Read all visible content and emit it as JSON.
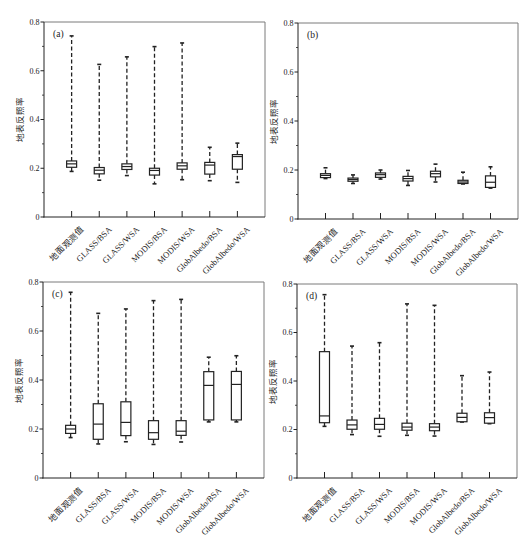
{
  "style": {
    "box_stroke": "#222222",
    "axis_color": "#222222",
    "frame_color": "#7a7a7a",
    "box_fill": "#ffffff",
    "background": "#ffffff"
  },
  "chart_data": [
    {
      "type": "box",
      "panel_label": "(a)",
      "title": "",
      "xlabel": "",
      "ylabel": "地表反照率",
      "ylim": [
        0,
        0.8
      ],
      "yticks": [
        0,
        0.2,
        0.4,
        0.6,
        0.8
      ],
      "ytick_labels": [
        "0",
        "0.2",
        "0.4",
        "0.6",
        "0.8"
      ],
      "minor_yticks": [
        0.1,
        0.3,
        0.5,
        0.7
      ],
      "grid": false,
      "legend": null,
      "categories": [
        "地面观测值",
        "GLASS/BSA",
        "GLASS/WSA",
        "MODIS/BSA",
        "MODIS/WSA",
        "GlobAlbedo/BSA",
        "GlobAlbedo/WSA"
      ],
      "boxes": [
        {
          "min": 0.187,
          "q1": 0.204,
          "median": 0.218,
          "q3": 0.23,
          "max": 0.743
        },
        {
          "min": 0.151,
          "q1": 0.177,
          "median": 0.192,
          "q3": 0.203,
          "max": 0.626
        },
        {
          "min": 0.17,
          "q1": 0.195,
          "median": 0.207,
          "q3": 0.218,
          "max": 0.657
        },
        {
          "min": 0.136,
          "q1": 0.172,
          "median": 0.191,
          "q3": 0.2,
          "max": 0.699
        },
        {
          "min": 0.153,
          "q1": 0.196,
          "median": 0.21,
          "q3": 0.222,
          "max": 0.714
        },
        {
          "min": 0.149,
          "q1": 0.176,
          "median": 0.213,
          "q3": 0.224,
          "max": 0.286
        },
        {
          "min": 0.142,
          "q1": 0.196,
          "median": 0.248,
          "q3": 0.256,
          "max": 0.303
        }
      ]
    },
    {
      "type": "box",
      "panel_label": "(b)",
      "title": "",
      "xlabel": "",
      "ylabel": "地表反照率",
      "ylim": [
        0,
        0.8
      ],
      "yticks": [
        0,
        0.2,
        0.4,
        0.6,
        0.8
      ],
      "ytick_labels": [
        "0",
        "0.2",
        "0.4",
        "0.6",
        "0.8"
      ],
      "minor_yticks": [
        0.1,
        0.3,
        0.5,
        0.7
      ],
      "grid": false,
      "legend": null,
      "categories": [
        "地面观测值",
        "GLASS/BSA",
        "GLASS/WSA",
        "MODIS/BSA",
        "MODIS/WSA",
        "GlobAlbedo/BSA",
        "GlobAlbedo/WSA"
      ],
      "boxes": [
        {
          "min": 0.165,
          "q1": 0.169,
          "median": 0.178,
          "q3": 0.185,
          "max": 0.209
        },
        {
          "min": 0.145,
          "q1": 0.154,
          "median": 0.161,
          "q3": 0.167,
          "max": 0.18
        },
        {
          "min": 0.163,
          "q1": 0.17,
          "median": 0.181,
          "q3": 0.188,
          "max": 0.2
        },
        {
          "min": 0.137,
          "q1": 0.155,
          "median": 0.165,
          "q3": 0.174,
          "max": 0.198
        },
        {
          "min": 0.151,
          "q1": 0.172,
          "median": 0.185,
          "q3": 0.195,
          "max": 0.224
        },
        {
          "min": 0.143,
          "q1": 0.145,
          "median": 0.151,
          "q3": 0.158,
          "max": 0.191
        },
        {
          "min": 0.126,
          "q1": 0.129,
          "median": 0.15,
          "q3": 0.176,
          "max": 0.213
        }
      ]
    },
    {
      "type": "box",
      "panel_label": "(c)",
      "title": "",
      "xlabel": "",
      "ylabel": "地表反照率",
      "ylim": [
        0,
        0.8
      ],
      "yticks": [
        0,
        0.2,
        0.4,
        0.6,
        0.8
      ],
      "ytick_labels": [
        "0",
        "0.2",
        "0.4",
        "0.6",
        "0.8"
      ],
      "minor_yticks": [
        0.1,
        0.3,
        0.5,
        0.7
      ],
      "grid": false,
      "legend": null,
      "categories": [
        "地面观测值",
        "GLASS/BSA",
        "GLASS/WSA",
        "MODIS/BSA",
        "MODIS/WSA",
        "GlobAlbedo/BSA",
        "GlobAlbedo/WSA"
      ],
      "boxes": [
        {
          "min": 0.165,
          "q1": 0.182,
          "median": 0.2,
          "q3": 0.215,
          "max": 0.758
        },
        {
          "min": 0.139,
          "q1": 0.158,
          "median": 0.22,
          "q3": 0.303,
          "max": 0.672
        },
        {
          "min": 0.148,
          "q1": 0.173,
          "median": 0.227,
          "q3": 0.311,
          "max": 0.69
        },
        {
          "min": 0.137,
          "q1": 0.158,
          "median": 0.185,
          "q3": 0.234,
          "max": 0.724
        },
        {
          "min": 0.147,
          "q1": 0.174,
          "median": 0.191,
          "q3": 0.234,
          "max": 0.729
        },
        {
          "min": 0.229,
          "q1": 0.237,
          "median": 0.378,
          "q3": 0.434,
          "max": 0.493
        },
        {
          "min": 0.229,
          "q1": 0.237,
          "median": 0.382,
          "q3": 0.435,
          "max": 0.499
        }
      ]
    },
    {
      "type": "box",
      "panel_label": "(d)",
      "title": "",
      "xlabel": "",
      "ylabel": "地表反照率",
      "ylim": [
        0,
        0.8
      ],
      "yticks": [
        0,
        0.2,
        0.4,
        0.6,
        0.8
      ],
      "ytick_labels": [
        "0",
        "0.2",
        "0.4",
        "0.6",
        "0.8"
      ],
      "minor_yticks": [
        0.1,
        0.3,
        0.5,
        0.7
      ],
      "grid": false,
      "legend": null,
      "categories": [
        "地面观测值",
        "GLASS/BSA",
        "GLASS/WSA",
        "MODIS/BSA",
        "MODIS/WSA",
        "GlobAlbedo/BSA",
        "GlobAlbedo/WSA"
      ],
      "boxes": [
        {
          "min": 0.213,
          "q1": 0.228,
          "median": 0.256,
          "q3": 0.521,
          "max": 0.756
        },
        {
          "min": 0.179,
          "q1": 0.201,
          "median": 0.219,
          "q3": 0.239,
          "max": 0.544
        },
        {
          "min": 0.172,
          "q1": 0.201,
          "median": 0.221,
          "q3": 0.246,
          "max": 0.558
        },
        {
          "min": 0.176,
          "q1": 0.197,
          "median": 0.21,
          "q3": 0.226,
          "max": 0.718
        },
        {
          "min": 0.173,
          "q1": 0.195,
          "median": 0.21,
          "q3": 0.224,
          "max": 0.712
        },
        {
          "min": 0.231,
          "q1": 0.232,
          "median": 0.25,
          "q3": 0.267,
          "max": 0.422
        },
        {
          "min": 0.224,
          "q1": 0.226,
          "median": 0.249,
          "q3": 0.269,
          "max": 0.437
        }
      ]
    }
  ]
}
